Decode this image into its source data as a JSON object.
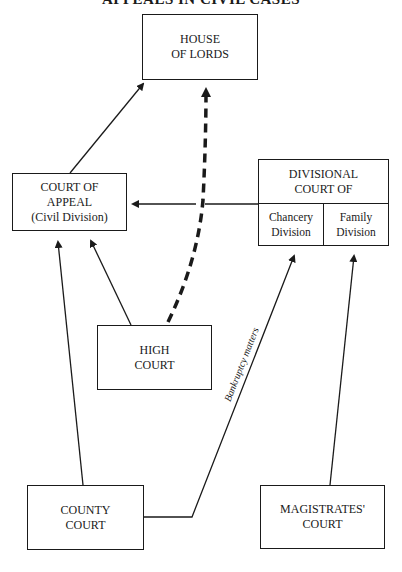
{
  "title": "APPEALS IN CIVIL CASES",
  "nodes": {
    "house_of_lords": {
      "line1": "HOUSE",
      "line2": "OF LORDS"
    },
    "court_of_appeal": {
      "line1": "COURT OF",
      "line2": "APPEAL",
      "line3": "(Civil Division)"
    },
    "divisional_court": {
      "line1": "DIVISIONAL",
      "line2": "COURT OF",
      "chancery": {
        "line1": "Chancery",
        "line2": "Division"
      },
      "family": {
        "line1": "Family",
        "line2": "Division"
      }
    },
    "high_court": {
      "line1": "HIGH",
      "line2": "COURT"
    },
    "county_court": {
      "line1": "COUNTY",
      "line2": "COURT"
    },
    "magistrates_court": {
      "line1": "MAGISTRATES'",
      "line2": "COURT"
    }
  },
  "edges": [
    {
      "from": "Court of Appeal",
      "to": "House of Lords",
      "style": "solid"
    },
    {
      "from": "High Court",
      "to": "House of Lords",
      "style": "dashed"
    },
    {
      "from": "Divisional Court",
      "to": "Court of Appeal",
      "style": "solid"
    },
    {
      "from": "High Court",
      "to": "Court of Appeal",
      "style": "solid"
    },
    {
      "from": "County Court",
      "to": "Court of Appeal",
      "style": "solid"
    },
    {
      "from": "County Court",
      "to": "Chancery Division",
      "style": "solid",
      "label": "Bankruptcy matters"
    },
    {
      "from": "Magistrates' Court",
      "to": "Family Division",
      "style": "solid"
    }
  ],
  "edge_label": "Bankruptcy matters"
}
